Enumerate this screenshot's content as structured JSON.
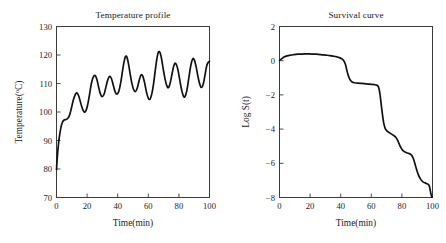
{
  "figure": {
    "background": "#ffffff",
    "line_color": "#111111",
    "axis_color": "#3b3b3b",
    "text_color": "#1a1a1a"
  },
  "panels": [
    {
      "name": "temperature-profile",
      "title": "Temperature profile",
      "xlabel": "Time(min)",
      "ylabel_main": "Temperature(",
      "ylabel_sup": "o",
      "ylabel_tail": "C)",
      "ylabel_full": "Temperature(°C)",
      "xticks": [
        "0",
        "20",
        "40",
        "60",
        "80",
        "100"
      ],
      "yticks": [
        "130",
        "120",
        "110",
        "100",
        "90",
        "80",
        "70"
      ]
    },
    {
      "name": "survival-curve",
      "title": "Survival curve",
      "xlabel": "Time(min)",
      "ylabel_full": "Log S(t)",
      "xticks": [
        "0",
        "20",
        "40",
        "60",
        "80",
        "100"
      ],
      "yticks": [
        "2",
        "0",
        "−2",
        "−4",
        "−6",
        "−8"
      ]
    }
  ],
  "chart_data": [
    {
      "type": "line",
      "title": "Temperature profile",
      "xlabel": "Time(min)",
      "ylabel": "Temperature(°C)",
      "xlim": [
        0,
        100
      ],
      "ylim": [
        70,
        130
      ],
      "xticks": [
        0,
        20,
        40,
        60,
        80,
        100
      ],
      "yticks": [
        70,
        80,
        90,
        100,
        110,
        120,
        130
      ],
      "grid": false,
      "legend": "none",
      "series": [
        {
          "name": "Temperature",
          "x": [
            0,
            0.8,
            1.8,
            2.8,
            3.8,
            5.0,
            6.2,
            7.4,
            8.6,
            9.8,
            11.0,
            12.2,
            13.2,
            14.4,
            15.6,
            16.8,
            18.0,
            19.2,
            20.4,
            21.6,
            22.8,
            24.0,
            25.2,
            26.4,
            27.6,
            28.8,
            30.0,
            31.2,
            32.4,
            33.6,
            34.8,
            36.0,
            37.2,
            38.4,
            39.6,
            40.8,
            42.0,
            43.2,
            44.4,
            45.6,
            46.8,
            48.0,
            49.2,
            50.4,
            51.6,
            52.8,
            54.0,
            55.2,
            56.4,
            57.6,
            58.8,
            60.0,
            61.2,
            62.4,
            63.6,
            64.8,
            66.0,
            67.2,
            68.4,
            69.6,
            70.8,
            72.0,
            73.2,
            74.4,
            75.6,
            76.8,
            78.0,
            79.2,
            80.4,
            81.6,
            82.8,
            84.0,
            85.2,
            86.4,
            87.6,
            88.8,
            90.0,
            91.2,
            92.4,
            93.6,
            94.8,
            96.0,
            97.2,
            98.4,
            100.0
          ],
          "y": [
            79.8,
            86.0,
            91.0,
            94.3,
            96.3,
            97.2,
            97.4,
            97.8,
            99.0,
            101.5,
            104.2,
            106.0,
            106.7,
            105.8,
            103.6,
            101.4,
            100.1,
            100.4,
            102.6,
            106.2,
            110.0,
            112.2,
            112.8,
            111.4,
            108.6,
            106.2,
            105.4,
            106.4,
            109.0,
            111.4,
            112.5,
            111.6,
            109.2,
            107.0,
            106.3,
            107.4,
            110.4,
            114.6,
            118.2,
            119.6,
            117.6,
            113.8,
            110.2,
            107.9,
            107.2,
            108.4,
            111.0,
            112.9,
            112.6,
            110.2,
            107.0,
            104.9,
            104.6,
            106.6,
            110.6,
            115.6,
            119.8,
            121.2,
            119.4,
            115.6,
            112.0,
            109.4,
            108.6,
            110.4,
            113.6,
            116.4,
            117.0,
            115.2,
            111.8,
            108.2,
            105.8,
            105.4,
            107.6,
            111.6,
            115.8,
            118.4,
            118.4,
            116.0,
            112.6,
            109.8,
            108.6,
            110.0,
            113.4,
            116.6,
            117.8,
            111.6
          ]
        }
      ]
    },
    {
      "type": "line",
      "title": "Survival curve",
      "xlabel": "Time(min)",
      "ylabel": "Log S(t)",
      "xlim": [
        0,
        100
      ],
      "ylim": [
        -8,
        2
      ],
      "xticks": [
        0,
        20,
        40,
        60,
        80,
        100
      ],
      "yticks": [
        -8,
        -6,
        -4,
        -2,
        0,
        2
      ],
      "grid": false,
      "legend": "none",
      "series": [
        {
          "name": "Log S(t)",
          "x": [
            0,
            1.5,
            3.0,
            5.0,
            7.0,
            9.0,
            12.0,
            15.0,
            18.0,
            21.0,
            24.0,
            27.0,
            30.0,
            33.0,
            35.5,
            37.5,
            39.0,
            40.5,
            41.5,
            42.5,
            43.3,
            44.0,
            44.8,
            45.6,
            46.5,
            47.5,
            49.0,
            51.0,
            54.0,
            57.0,
            60.0,
            62.0,
            63.5,
            64.5,
            65.2,
            65.8,
            66.4,
            67.0,
            67.6,
            68.2,
            69.0,
            70.0,
            71.0,
            72.0,
            73.0,
            74.0,
            75.0,
            76.0,
            77.0,
            78.0,
            79.0,
            80.0,
            81.0,
            82.0,
            83.0,
            84.0,
            85.0,
            86.0,
            87.0,
            88.0,
            89.0,
            90.0,
            91.0,
            92.0,
            93.0,
            94.0,
            95.0,
            96.0,
            97.0,
            97.8,
            98.4,
            99.0,
            99.6
          ],
          "y": [
            0.02,
            0.12,
            0.21,
            0.28,
            0.32,
            0.35,
            0.38,
            0.39,
            0.4,
            0.39,
            0.38,
            0.36,
            0.33,
            0.3,
            0.26,
            0.22,
            0.18,
            0.12,
            0.05,
            -0.08,
            -0.28,
            -0.55,
            -0.82,
            -1.02,
            -1.16,
            -1.24,
            -1.29,
            -1.31,
            -1.33,
            -1.35,
            -1.38,
            -1.4,
            -1.43,
            -1.5,
            -1.7,
            -2.05,
            -2.5,
            -2.95,
            -3.35,
            -3.68,
            -3.94,
            -4.08,
            -4.16,
            -4.22,
            -4.28,
            -4.34,
            -4.4,
            -4.48,
            -4.62,
            -4.82,
            -5.02,
            -5.18,
            -5.28,
            -5.34,
            -5.38,
            -5.41,
            -5.44,
            -5.5,
            -5.62,
            -5.86,
            -6.18,
            -6.48,
            -6.72,
            -6.9,
            -7.02,
            -7.1,
            -7.14,
            -7.18,
            -7.22,
            -7.3,
            -7.52,
            -7.8,
            -7.98
          ]
        }
      ]
    }
  ]
}
